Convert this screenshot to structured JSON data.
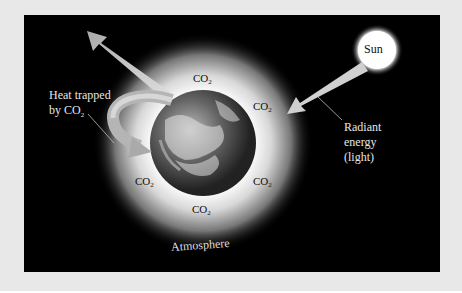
{
  "figure": {
    "sun_label": "Sun",
    "radiant_energy_label": [
      "Radiant",
      "energy",
      "(light)"
    ],
    "heat_trapped_label": [
      "Heat trapped",
      "by CO"
    ],
    "heat_trapped_subscript": "2",
    "atmosphere_label": "Atmosphere",
    "co2_labels": [
      {
        "text": "CO",
        "sub": "2",
        "pos": "top"
      },
      {
        "text": "CO",
        "sub": "2",
        "pos": "upper-right"
      },
      {
        "text": "CO",
        "sub": "2",
        "pos": "left"
      },
      {
        "text": "CO",
        "sub": "2",
        "pos": "lower-right"
      },
      {
        "text": "CO",
        "sub": "2",
        "pos": "bottom"
      }
    ],
    "colors": {
      "background": "#000000",
      "page": "#e8e8e8",
      "arrow": "#c8c8c8",
      "text": "#e6e6e6"
    }
  }
}
